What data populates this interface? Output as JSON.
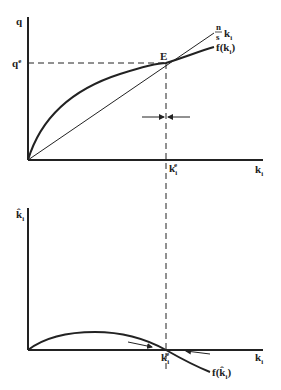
{
  "top_panel": {
    "y_axis_label": "q",
    "equilibrium_q_label": "q",
    "equilibrium_q_sup": "e",
    "equilibrium_point_label": "E",
    "line_label_num": "n",
    "line_label_den": "s",
    "line_label_var": "k",
    "line_label_sub": "i",
    "curve_label": "f(k",
    "curve_label_sub": "i",
    "curve_label_close": ")",
    "x_eq_label": "k",
    "x_eq_sub": "i",
    "x_eq_sup": "e",
    "x_axis_label": "k",
    "x_axis_sub": "i"
  },
  "bottom_panel": {
    "y_axis_label": "k̂",
    "y_axis_sub": "i",
    "x_eq_label": "k",
    "x_eq_sub": "i",
    "x_eq_sup": "e",
    "x_axis_label": "k",
    "x_axis_sub": "i",
    "curve_label": "f(k̂",
    "curve_label_sub": "i",
    "curve_label_close": ")"
  },
  "colors": {
    "ink": "#222222",
    "background": "#ffffff"
  }
}
